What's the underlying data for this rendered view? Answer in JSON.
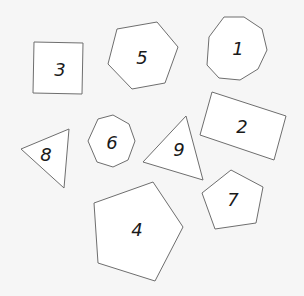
{
  "canvas": {
    "width": 304,
    "height": 296,
    "background": "#f6f6f6"
  },
  "style": {
    "fill": "#ffffff",
    "stroke": "#6e6e6e",
    "label_color": "#1a1a1a"
  },
  "shapes": [
    {
      "label": "1",
      "type": "nonagon",
      "points": "224,17 244,17 262,29 267,50 258,69 240,80 219,78 207,65 209,37",
      "cx": 238,
      "cy": 48
    },
    {
      "label": "2",
      "type": "rectangle",
      "points": "212,92 286,116 274,160 200,135",
      "cx": 242,
      "cy": 126
    },
    {
      "label": "3",
      "type": "square",
      "points": "34,42 83,43 82,94 33,93",
      "cx": 60,
      "cy": 69
    },
    {
      "label": "4",
      "type": "pentagon",
      "points": "94,203 153,182 183,227 155,281 98,263",
      "cx": 137,
      "cy": 229
    },
    {
      "label": "5",
      "type": "hexagon",
      "points": "117,29 157,22 178,47 165,83 132,89 108,64",
      "cx": 142,
      "cy": 57
    },
    {
      "label": "6",
      "type": "octagon",
      "points": "98,119 113,115 129,124 135,141 128,160 113,167 97,162 88,141",
      "cx": 112,
      "cy": 142
    },
    {
      "label": "7",
      "type": "pentagon",
      "points": "202,193 231,170 263,187 256,223 215,229",
      "cx": 233,
      "cy": 199
    },
    {
      "label": "8",
      "type": "triangle",
      "points": "21,149 69,129 64,188",
      "cx": 46,
      "cy": 154
    },
    {
      "label": "9",
      "type": "triangle",
      "points": "143,162 186,116 203,180",
      "cx": 179,
      "cy": 149
    }
  ]
}
